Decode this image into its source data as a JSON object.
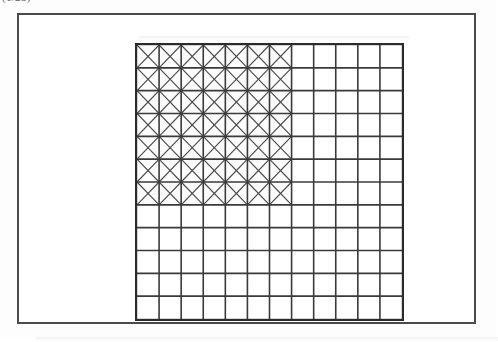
{
  "caption": {
    "text": "(1/25)"
  },
  "figure": {
    "frame_color": "#4a4a4a",
    "background_color": "#ffffff"
  },
  "chart_data": {
    "type": "heatmap",
    "title": "",
    "subtitle": "",
    "xlabel": "",
    "ylabel": "",
    "grid": true,
    "columns": 12,
    "rows": 12,
    "x": [
      1,
      2,
      3,
      4,
      5,
      6,
      7,
      8,
      9,
      10,
      11,
      12
    ],
    "categories": [
      "1",
      "2",
      "3",
      "4",
      "5",
      "6",
      "7",
      "8",
      "9",
      "10",
      "11",
      "12"
    ],
    "braced_columns": 7,
    "braced_rows": 7,
    "cell_fill_empty": "#ffffff",
    "line_color": "#3a3a3a",
    "diagonal_color": "#4a4a4a",
    "border_color": "#2b2b2b",
    "legend": [],
    "annotations": [],
    "values": [
      [
        1,
        1,
        1,
        1,
        1,
        1,
        1,
        0,
        0,
        0,
        0,
        0
      ],
      [
        1,
        1,
        1,
        1,
        1,
        1,
        1,
        0,
        0,
        0,
        0,
        0
      ],
      [
        1,
        1,
        1,
        1,
        1,
        1,
        1,
        0,
        0,
        0,
        0,
        0
      ],
      [
        1,
        1,
        1,
        1,
        1,
        1,
        1,
        0,
        0,
        0,
        0,
        0
      ],
      [
        1,
        1,
        1,
        1,
        1,
        1,
        1,
        0,
        0,
        0,
        0,
        0
      ],
      [
        1,
        1,
        1,
        1,
        1,
        1,
        1,
        0,
        0,
        0,
        0,
        0
      ],
      [
        1,
        1,
        1,
        1,
        1,
        1,
        1,
        0,
        0,
        0,
        0,
        0
      ],
      [
        0,
        0,
        0,
        0,
        0,
        0,
        0,
        0,
        0,
        0,
        0,
        0
      ],
      [
        0,
        0,
        0,
        0,
        0,
        0,
        0,
        0,
        0,
        0,
        0,
        0
      ],
      [
        0,
        0,
        0,
        0,
        0,
        0,
        0,
        0,
        0,
        0,
        0,
        0
      ],
      [
        0,
        0,
        0,
        0,
        0,
        0,
        0,
        0,
        0,
        0,
        0,
        0
      ],
      [
        0,
        0,
        0,
        0,
        0,
        0,
        0,
        0,
        0,
        0,
        0,
        0
      ]
    ]
  }
}
